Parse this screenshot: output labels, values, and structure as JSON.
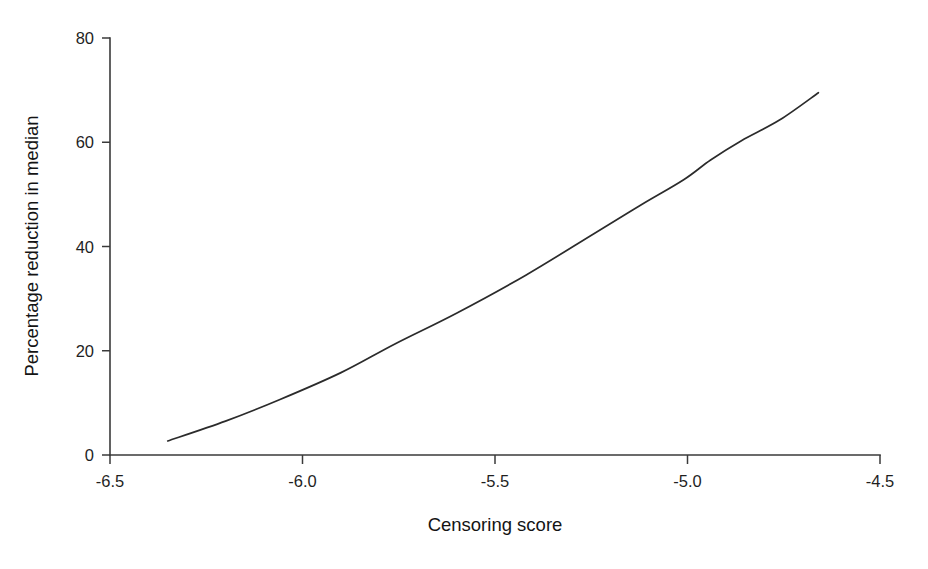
{
  "chart_data": {
    "type": "line",
    "title": "",
    "xlabel": "Censoring score",
    "ylabel": "Percentage reduction in median",
    "xlim": [
      -6.5,
      -4.5
    ],
    "ylim": [
      0,
      80
    ],
    "xticks": [
      -6.5,
      -6.0,
      -5.5,
      -5.0,
      -4.5
    ],
    "xticklabels": [
      "-6.5",
      "-6.0",
      "-5.5",
      "-5.0",
      "-4.5"
    ],
    "yticks": [
      0,
      20,
      40,
      60,
      80
    ],
    "yticklabels": [
      "0",
      "20",
      "40",
      "60",
      "80"
    ],
    "grid": false,
    "legend": false,
    "legend_position": "none",
    "line_color": "#2b2b2b",
    "axis_color": "#3a3a3a",
    "background_color": "#ffffff",
    "series": [
      {
        "name": "Percentage reduction in median",
        "x": [
          -6.35,
          -6.2,
          -6.06,
          -5.9,
          -5.76,
          -5.6,
          -5.42,
          -5.24,
          -5.12,
          -5.01,
          -4.94,
          -4.86,
          -4.76,
          -4.66
        ],
        "y": [
          2.7,
          6.5,
          10.6,
          15.8,
          21.3,
          27.2,
          34.5,
          42.6,
          48.0,
          52.8,
          56.6,
          60.3,
          64.3,
          69.5
        ]
      }
    ],
    "x_start": -6.35,
    "x_end": -4.66,
    "y_start": 2.7,
    "y_end": 69.5
  },
  "axes": {
    "x_title": "Censoring score",
    "y_title": "Percentage reduction in median"
  }
}
